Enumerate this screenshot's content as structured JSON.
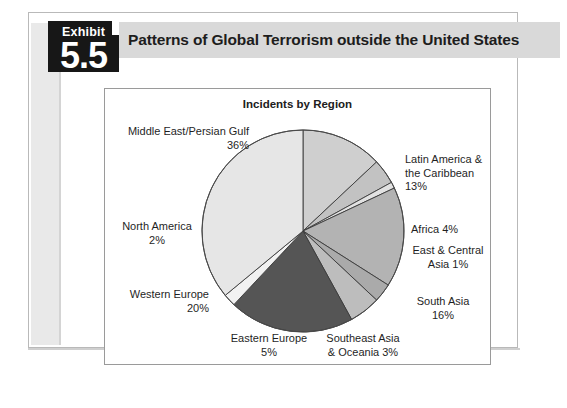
{
  "page": {
    "exhibit": {
      "word": "Exhibit",
      "number": "5.5"
    },
    "header_title": "Patterns of Global Terrorism outside the United States",
    "header_bg": "#d9d9d9",
    "badge_bg": "#171717"
  },
  "chart_data": {
    "type": "pie",
    "title": "Incidents by Region",
    "units": "%",
    "start_angle_deg": 0,
    "direction": "clockwise",
    "legend_position": "outside-labels",
    "grid": false,
    "categories": [
      "Latin America & the Caribbean",
      "Africa",
      "East & Central Asia",
      "South Asia",
      "Southeast Asia & Oceania",
      "Eastern Europe",
      "Western Europe",
      "North America",
      "Middle East/Persian Gulf"
    ],
    "values": [
      13,
      4,
      1,
      16,
      3,
      5,
      20,
      2,
      36
    ],
    "colors": [
      "#cfcfcf",
      "#c2c2c2",
      "#e2e2e2",
      "#b3b3b3",
      "#aaaaaa",
      "#bdbdbd",
      "#555555",
      "#f2f2f2",
      "#e6e6e6"
    ],
    "slices": [
      {
        "label": "Latin America & the Caribbean",
        "value": 13,
        "color": "#cfcfcf"
      },
      {
        "label": "Africa",
        "value": 4,
        "color": "#c2c2c2"
      },
      {
        "label": "East & Central Asia",
        "value": 1,
        "color": "#e2e2e2"
      },
      {
        "label": "South Asia",
        "value": 16,
        "color": "#b3b3b3"
      },
      {
        "label": "Southeast Asia & Oceania",
        "value": 3,
        "color": "#aaaaaa"
      },
      {
        "label": "Eastern Europe",
        "value": 5,
        "color": "#bdbdbd"
      },
      {
        "label": "Western Europe",
        "value": 20,
        "color": "#555555"
      },
      {
        "label": "North America",
        "value": 2,
        "color": "#f2f2f2"
      },
      {
        "label": "Middle East/Persian Gulf",
        "value": 36,
        "color": "#e6e6e6"
      }
    ]
  },
  "labels": {
    "middle_east": "Middle East/Persian Gulf\n36%",
    "latin_america": "Latin America &\nthe Caribbean\n13%",
    "africa": "Africa 4%",
    "east_central_asia": "East & Central\nAsia 1%",
    "south_asia": "South Asia\n16%",
    "southeast_asia": "Southeast Asia\n& Oceania 3%",
    "eastern_europe": "Eastern Europe\n5%",
    "western_europe": "Western Europe\n20%",
    "north_america": "North America\n2%"
  }
}
